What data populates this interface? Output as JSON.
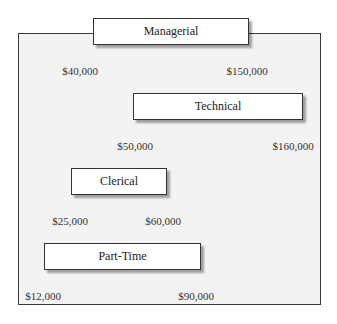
{
  "diagram": {
    "bands": [
      {
        "name": "Managerial",
        "min_label": "$40,000",
        "max_label": "$150,000"
      },
      {
        "name": "Technical",
        "min_label": "$50,000",
        "max_label": "$160,000"
      },
      {
        "name": "Clerical",
        "min_label": "$25,000",
        "max_label": "$60,000"
      },
      {
        "name": "Part-Time",
        "min_label": "$12,000",
        "max_label": "$90,000"
      }
    ]
  }
}
